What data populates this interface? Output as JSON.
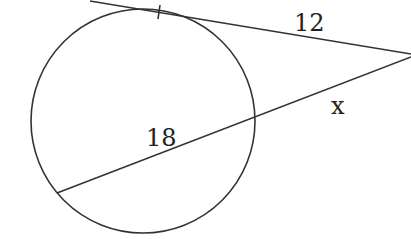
{
  "diagram": {
    "type": "geometry-tangent-secant",
    "labels": {
      "tangent_length": "12",
      "secant_internal_chord": "18",
      "secant_external_segment": "x"
    },
    "colors": {
      "stroke": "#333333",
      "text": "#222222",
      "background": "#ffffff"
    },
    "elements": {
      "circle": {
        "cx": 143,
        "cy": 121,
        "r": 112
      },
      "tangent_line": {
        "x1": 90,
        "y1": 1,
        "x2": 411,
        "y2": 54
      },
      "tangent_tick": {
        "x1": 160,
        "y1": 5,
        "x2": 158,
        "y2": 19
      },
      "secant_line": {
        "x1": 57,
        "y1": 193,
        "x2": 411,
        "y2": 57
      }
    }
  }
}
